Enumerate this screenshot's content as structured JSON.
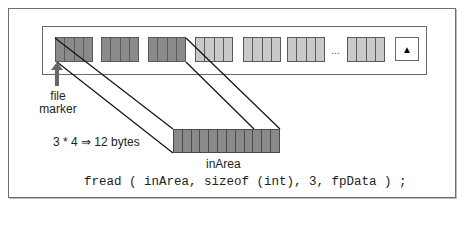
{
  "diagram": {
    "type": "file-read-illustration",
    "file_strip": {
      "groups": [
        {
          "shade": "dark",
          "cells": 4
        },
        {
          "shade": "dark",
          "cells": 4
        },
        {
          "shade": "dark",
          "cells": 4
        },
        {
          "shade": "light",
          "cells": 4
        },
        {
          "shade": "light",
          "cells": 4
        },
        {
          "shade": "light",
          "cells": 4
        },
        {
          "shade": "light",
          "cells": 4
        }
      ],
      "ellipsis": "...",
      "eof_icon": "▲"
    },
    "file_marker_label_line1": "file",
    "file_marker_label_line2": "marker",
    "bytes_label": "3 * 4 ⇒ 12 bytes",
    "buffer": {
      "label": "inArea",
      "cells": 12
    },
    "code": "fread ( inArea, sizeof (int), 3, fpData ) ;",
    "colors": {
      "dark_cell": "#8a8a8a",
      "light_cell": "#c9c9c9",
      "border": "#5a5a5a"
    }
  }
}
